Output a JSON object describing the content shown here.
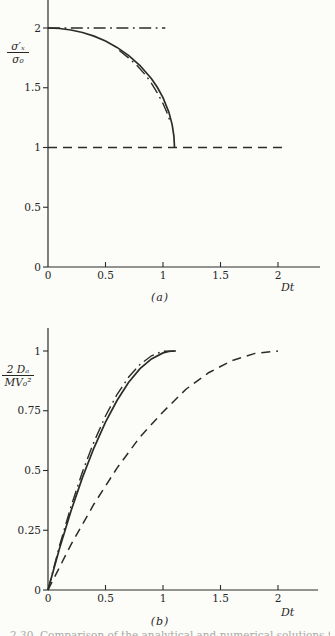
{
  "page": {
    "background": "#fcfcf9",
    "ink": "#2b2b2b",
    "caption_fragment": "2.30. Comparison of the analytical and numerical solutions for the"
  },
  "chart_data": [
    {
      "id": "a",
      "type": "line",
      "title": "",
      "xlabel": "Dt",
      "ylabel_numerator": "σ′ₓ",
      "ylabel_denominator": "σ₀",
      "caption": "(a)",
      "xlim": [
        0,
        2.37
      ],
      "ylim": [
        0,
        2.23
      ],
      "grid": false,
      "legend": "none",
      "x_ticks": [
        {
          "v": 0,
          "label": "0"
        },
        {
          "v": 0.5,
          "label": "0.5"
        },
        {
          "v": 1,
          "label": "1"
        },
        {
          "v": 1.5,
          "label": "1.5"
        },
        {
          "v": 2,
          "label": "2"
        }
      ],
      "y_ticks": [
        {
          "v": 0,
          "label": "0"
        },
        {
          "v": 0.5,
          "label": "0.5"
        },
        {
          "v": 1,
          "label": "1"
        },
        {
          "v": 1.5,
          "label": "1.5"
        },
        {
          "v": 2,
          "label": "2"
        }
      ],
      "series": [
        {
          "name": "dashdot-horizontal-line",
          "style": "dashdot",
          "points": [
            [
              0,
              2
            ],
            [
              1.02,
              2
            ]
          ]
        },
        {
          "name": "solid-curve",
          "style": "solid",
          "points": [
            [
              0,
              2
            ],
            [
              0.1,
              1.996
            ],
            [
              0.2,
              1.983
            ],
            [
              0.3,
              1.962
            ],
            [
              0.4,
              1.932
            ],
            [
              0.5,
              1.891
            ],
            [
              0.6,
              1.838
            ],
            [
              0.7,
              1.771
            ],
            [
              0.8,
              1.686
            ],
            [
              0.9,
              1.575
            ],
            [
              0.95,
              1.504
            ],
            [
              1.0,
              1.417
            ],
            [
              1.05,
              1.298
            ],
            [
              1.08,
              1.19
            ],
            [
              1.095,
              1.095
            ],
            [
              1.1,
              1.0
            ]
          ]
        },
        {
          "name": "dashdot-curve",
          "style": "dashdot",
          "points": [
            [
              0.62,
              1.812
            ],
            [
              0.7,
              1.75
            ],
            [
              0.78,
              1.68
            ],
            [
              0.85,
              1.603
            ],
            [
              0.9,
              1.537
            ],
            [
              0.95,
              1.458
            ],
            [
              1.0,
              1.368
            ],
            [
              1.03,
              1.303
            ],
            [
              1.05,
              1.252
            ],
            [
              1.065,
              1.205
            ]
          ]
        },
        {
          "name": "dashed-horizontal-line",
          "style": "dashed",
          "points": [
            [
              0,
              1
            ],
            [
              2.06,
              1
            ]
          ]
        }
      ]
    },
    {
      "id": "b",
      "type": "line",
      "title": "",
      "xlabel": "Dt",
      "ylabel_numerator": "2 Dₐ",
      "ylabel_denominator": "MV₀²",
      "caption": "(b)",
      "xlim": [
        0,
        2.35
      ],
      "ylim": [
        0,
        1.1
      ],
      "grid": false,
      "legend": "none",
      "x_ticks": [
        {
          "v": 0,
          "label": "0"
        },
        {
          "v": 0.5,
          "label": "0.5"
        },
        {
          "v": 1,
          "label": "1"
        },
        {
          "v": 1.5,
          "label": "1.5"
        },
        {
          "v": 2,
          "label": "2"
        }
      ],
      "y_ticks": [
        {
          "v": 0,
          "label": "0"
        },
        {
          "v": 0.25,
          "label": "0.25"
        },
        {
          "v": 0.5,
          "label": "0.5"
        },
        {
          "v": 0.75,
          "label": "0.75"
        },
        {
          "v": 1,
          "label": "1"
        }
      ],
      "series": [
        {
          "name": "solid-curve",
          "style": "solid",
          "points": [
            [
              0,
              0
            ],
            [
              0.1,
              0.174
            ],
            [
              0.2,
              0.331
            ],
            [
              0.3,
              0.471
            ],
            [
              0.4,
              0.595
            ],
            [
              0.5,
              0.702
            ],
            [
              0.6,
              0.793
            ],
            [
              0.7,
              0.868
            ],
            [
              0.8,
              0.926
            ],
            [
              0.9,
              0.967
            ],
            [
              1.0,
              0.992
            ],
            [
              1.05,
              0.998
            ],
            [
              1.1,
              1.0
            ]
          ]
        },
        {
          "name": "dashdot-curve",
          "style": "dashdot",
          "points": [
            [
              0,
              0
            ],
            [
              0.1,
              0.185
            ],
            [
              0.2,
              0.35
            ],
            [
              0.3,
              0.495
            ],
            [
              0.4,
              0.62
            ],
            [
              0.5,
              0.728
            ],
            [
              0.6,
              0.818
            ],
            [
              0.7,
              0.89
            ],
            [
              0.8,
              0.944
            ],
            [
              0.9,
              0.98
            ],
            [
              1.0,
              0.999
            ],
            [
              1.12,
              1.0
            ]
          ]
        },
        {
          "name": "dashed-curve",
          "style": "dashed",
          "points": [
            [
              0,
              0
            ],
            [
              0.2,
              0.19
            ],
            [
              0.4,
              0.36
            ],
            [
              0.6,
              0.51
            ],
            [
              0.8,
              0.64
            ],
            [
              1.0,
              0.745
            ],
            [
              1.2,
              0.84
            ],
            [
              1.4,
              0.91
            ],
            [
              1.6,
              0.96
            ],
            [
              1.8,
              0.99
            ],
            [
              2.0,
              1.0
            ]
          ]
        }
      ]
    }
  ]
}
